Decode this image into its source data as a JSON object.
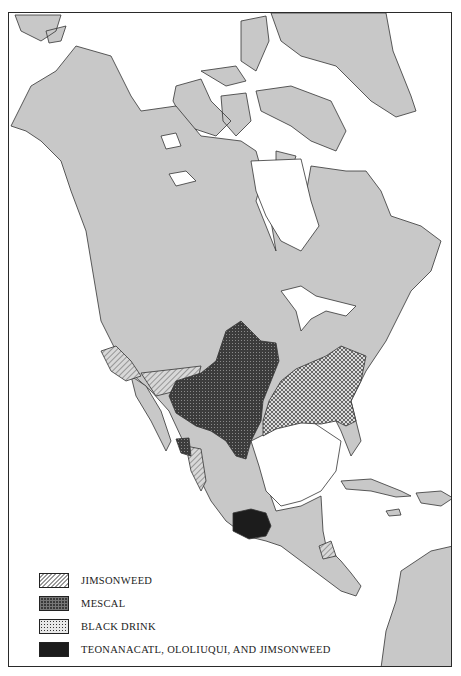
{
  "map": {
    "title": "",
    "region": "North and Central America",
    "land_color": "#c8c8c8",
    "water_color": "#ffffff",
    "outline_color": "#333333"
  },
  "legend": {
    "items": [
      {
        "label": "JIMSONWEED",
        "pattern": "diagonal-hatch"
      },
      {
        "label": "MESCAL",
        "pattern": "dark-grid"
      },
      {
        "label": "BLACK DRINK",
        "pattern": "checker-dots"
      },
      {
        "label": "TEONANACATL, OLOLIUQUI, AND JIMSONWEED",
        "pattern": "solid-black"
      }
    ]
  }
}
